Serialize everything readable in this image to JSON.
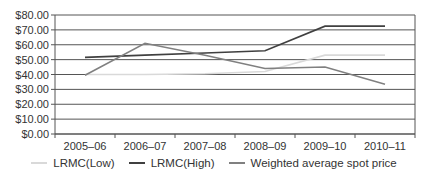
{
  "chart_data": {
    "type": "line",
    "title": "",
    "xlabel": "",
    "ylabel": "",
    "categories": [
      "2005–06",
      "2006–07",
      "2007–08",
      "2008–09",
      "2009–10",
      "2010–11"
    ],
    "ylim": [
      0,
      80
    ],
    "yticks": [
      0,
      10,
      20,
      30,
      40,
      50,
      60,
      70,
      80
    ],
    "ytick_labels": [
      "$0.00",
      "$10.00",
      "$20.00",
      "$30.00",
      "$40.00",
      "$50.00",
      "$60.00",
      "$70.00",
      "$80.00"
    ],
    "grid": true,
    "legend_position": "bottom",
    "series": [
      {
        "name": "LRMC(Low)",
        "color": "#d9d9d9",
        "values": [
          40,
          40,
          40.5,
          42,
          53,
          53
        ]
      },
      {
        "name": "LRMC(High)",
        "color": "#404040",
        "values": [
          51.5,
          53,
          54.5,
          56,
          72.5,
          72.5
        ]
      },
      {
        "name": "Weighted average spot price",
        "color": "#808080",
        "values": [
          39.5,
          61,
          53,
          44,
          45,
          33.5
        ]
      }
    ]
  }
}
